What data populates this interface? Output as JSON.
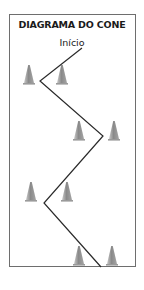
{
  "diagram": {
    "title": "DIAGRAMA DO CONE",
    "start_label": "Início",
    "colors": {
      "border": "#6e6e6e",
      "path": "#2a2a2a",
      "cone_light": "#b9b9b9",
      "cone_dark": "#7d7d7d"
    },
    "path_points": [
      [
        82,
        48
      ],
      [
        40,
        81
      ],
      [
        103,
        136
      ],
      [
        44,
        203
      ],
      [
        101,
        267
      ]
    ],
    "cones": [
      {
        "x": 29,
        "y": 80
      },
      {
        "x": 62,
        "y": 80
      },
      {
        "x": 79,
        "y": 136
      },
      {
        "x": 114,
        "y": 136
      },
      {
        "x": 31,
        "y": 197
      },
      {
        "x": 67,
        "y": 197
      },
      {
        "x": 79,
        "y": 261
      },
      {
        "x": 112,
        "y": 261
      }
    ]
  }
}
